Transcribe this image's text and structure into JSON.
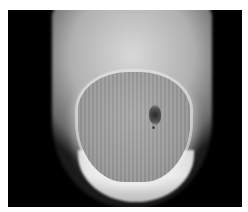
{
  "image": {
    "subject": "grayscale photograph of a fingertip nail with a dark pigmented spot",
    "colors": {
      "background": "#000000",
      "frame": "#ffffff",
      "nail": "#9a9a9a",
      "spot": "#2a2a2a"
    }
  }
}
